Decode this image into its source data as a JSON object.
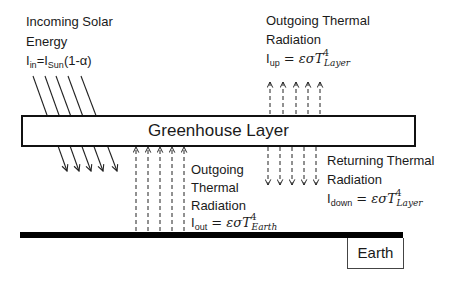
{
  "diagram": {
    "incoming_solar": {
      "label_line1": "Incoming Solar",
      "label_line2": "Energy",
      "eq_lhs": "I",
      "eq_lhs_sub": "in",
      "eq_mid": "=I",
      "eq_mid_sub": "Sun",
      "eq_rhs": "(1-α)",
      "arrow_count": 5,
      "arrow_style": "solid-diagonal-down"
    },
    "outgoing_layer": {
      "label_line1": "Outgoing Thermal",
      "label_line2": "Radiation",
      "eq_lhs": "I",
      "eq_lhs_sub": "up",
      "eq_rhs": " = εσT",
      "eq_exp": "4",
      "eq_sub": "Layer",
      "arrow_count": 5,
      "arrow_style": "dashed-up"
    },
    "greenhouse_layer": {
      "label": "Greenhouse Layer"
    },
    "returning": {
      "label_line1": "Returning Thermal",
      "label_line2": "Radiation",
      "eq_lhs": "I",
      "eq_lhs_sub": "down",
      "eq_rhs": " = εσT",
      "eq_exp": "4",
      "eq_sub": "Layer",
      "arrow_count": 5,
      "arrow_style": "dashed-down"
    },
    "outgoing_earth": {
      "label_line1": "Outgoing",
      "label_line2": "Thermal",
      "label_line3": "Radiation",
      "eq_lhs": "I",
      "eq_lhs_sub": "out",
      "eq_rhs": " = εσT",
      "eq_exp": "4",
      "eq_sub": "Earth",
      "arrow_count": 5,
      "arrow_style": "dashed-up"
    },
    "earth": {
      "label": "Earth"
    },
    "colors": {
      "line": "#111111",
      "background": "#ffffff"
    }
  }
}
